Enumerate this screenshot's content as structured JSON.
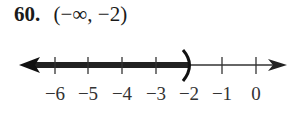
{
  "problem": {
    "number": "60.",
    "interval": "(−∞, −2)"
  },
  "number_line": {
    "ticks": [
      {
        "value": -6,
        "label": "−6"
      },
      {
        "value": -5,
        "label": "−5"
      },
      {
        "value": -4,
        "label": "−4"
      },
      {
        "value": -3,
        "label": "−3"
      },
      {
        "value": -2,
        "label": "−2"
      },
      {
        "value": -1,
        "label": "−1"
      },
      {
        "value": 0,
        "label": "0"
      }
    ],
    "shaded_from": "-infinity",
    "shaded_to": -2,
    "endpoint": "open parenthesis",
    "line_color": "#1a1a1a"
  }
}
